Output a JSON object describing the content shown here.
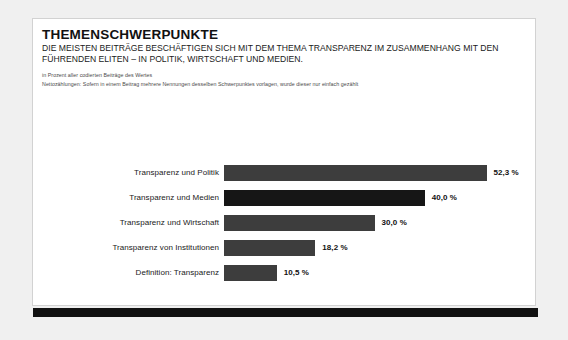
{
  "chart_data": {
    "type": "bar",
    "orientation": "horizontal",
    "title": "THEMENSCHWERPUNKTE",
    "subtitle": "DIE MEISTEN BEITRÄGE BESCHÄFTIGEN SICH MIT DEM THEMA TRANSPARENZ IM ZUSAMMENHANG MIT DEN FÜHRENDEN ELITEN – IN POLITIK, WIRTSCHAFT UND MEDIEN.",
    "notes": [
      "in Prozent aller codierten Beiträge des Wertes",
      "Nettozählungen: Sofern in einem Beitrag mehrere Nennungen desselben Schwerpunktes vorlagen, wurde dieser nur einfach gezählt"
    ],
    "xlabel": "",
    "ylabel": "",
    "xlim": [
      0,
      55
    ],
    "grid": false,
    "legend": false,
    "unit": "%",
    "bar_color": "#3d3d3d",
    "highlight_color": "#161616",
    "categories": [
      "Transparenz und Politik",
      "Transparenz und Medien",
      "Transparenz und Wirtschaft",
      "Transparenz von Institutionen",
      "Definition: Transparenz"
    ],
    "values": [
      52.3,
      40.0,
      30.0,
      18.2,
      10.5
    ],
    "value_labels": [
      "52,3 %",
      "40,0 %",
      "30,0 %",
      "18,2 %",
      "10,5 %"
    ],
    "highlighted_index": 1
  }
}
